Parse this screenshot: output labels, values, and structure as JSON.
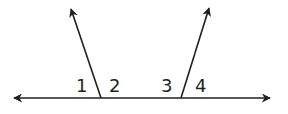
{
  "diagram": {
    "type": "angle-pairs",
    "stroke_color": "#231f20",
    "background": "#ffffff",
    "line": {
      "x1": 14,
      "y1": 98,
      "x2": 270,
      "y2": 98
    },
    "rays": [
      {
        "from": [
          101,
          98
        ],
        "to": [
          71,
          9
        ]
      },
      {
        "from": [
          181,
          98
        ],
        "to": [
          209,
          8
        ]
      }
    ],
    "labels": [
      {
        "text": "1",
        "x": 80,
        "y": 91
      },
      {
        "text": "2",
        "x": 111,
        "y": 91
      },
      {
        "text": "3",
        "x": 161,
        "y": 91
      },
      {
        "text": "4",
        "x": 195,
        "y": 91
      }
    ]
  }
}
